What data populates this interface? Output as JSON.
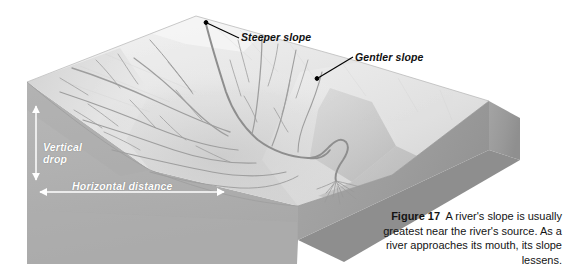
{
  "figure": {
    "number_label": "Figure 17",
    "caption_text": "A river's slope is usually greatest near the river's source. As a river approaches its mouth, its slope lessens.",
    "alt_description": "Three-dimensional block diagram of a landscape showing a dendritic river network flowing from a steep upland down to a gentle lowland and a delta at the river's mouth."
  },
  "callouts": [
    {
      "id": "steeper-slope",
      "label": "Steeper slope",
      "leader_from": [
        239,
        38
      ],
      "leader_to": [
        205,
        22
      ]
    },
    {
      "id": "gentler-slope",
      "label": "Gentler slope",
      "leader_from": [
        353,
        58
      ],
      "leader_to": [
        316,
        79
      ]
    }
  ],
  "measurements": [
    {
      "id": "vertical-drop",
      "label_line_1": "Vertical",
      "label_line_2": "drop",
      "orientation": "vertical",
      "arrow_from": [
        36,
        106
      ],
      "arrow_to": [
        36,
        180
      ]
    },
    {
      "id": "horizontal-distance",
      "label": "Horizontal distance",
      "orientation": "horizontal",
      "arrow_from": [
        40,
        192
      ],
      "arrow_to": [
        224,
        192
      ]
    }
  ],
  "colors": {
    "background": "#ffffff",
    "upland_highlight": "#ececec",
    "upland_mid": "#dedede",
    "lowland_plain": "#e2e2e2",
    "front_face": "#b3b3b3",
    "front_face_dark": "#a6a6a6",
    "right_face": "#9d9d9d",
    "right_face_light": "#c6c6c6",
    "river_line": "#9a9a9a",
    "callout_text": "#111111",
    "measure_text": "#ffffff",
    "caption_text": "#141414",
    "leader_line": "#000000"
  },
  "scene": {
    "title": "River slope block diagram",
    "features": [
      {
        "name": "steep-upland-surface",
        "description": "Steeply sloping highland surface in upper left of block"
      },
      {
        "name": "river-network",
        "description": "Dendritic tributary network converging into a main channel"
      },
      {
        "name": "main-river-channel",
        "description": "Meandering trunk stream flowing toward lower right"
      },
      {
        "name": "river-delta",
        "description": "Fan of distributary channels at the river's mouth"
      },
      {
        "name": "gentle-lowland-plain",
        "description": "Low-gradient plain on right side of block"
      },
      {
        "name": "block-front-face",
        "description": "Cut-away front face of the ground block"
      },
      {
        "name": "block-right-face",
        "description": "Cut-away right-side face of the ground block"
      }
    ]
  }
}
